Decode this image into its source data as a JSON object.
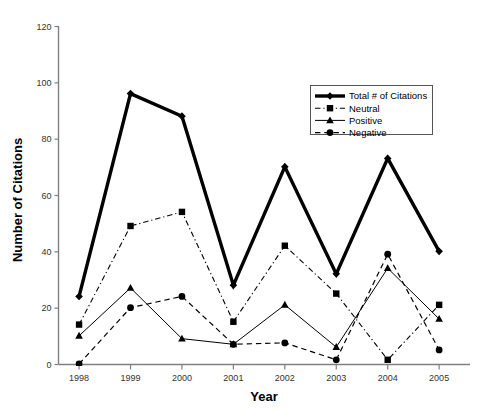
{
  "chart_data": {
    "type": "line",
    "title": "",
    "xlabel": "Year",
    "ylabel": "Number of Citations",
    "categories": [
      "1998",
      "1999",
      "2000",
      "2001",
      "2002",
      "2003",
      "2004",
      "2005"
    ],
    "x": [
      1998,
      1999,
      2000,
      2001,
      2002,
      2003,
      2004,
      2005
    ],
    "xlim": [
      1997.6,
      2005.6
    ],
    "ylim": [
      0,
      120
    ],
    "yticks": [
      0,
      20,
      40,
      60,
      80,
      100,
      120
    ],
    "grid": false,
    "legend_position": "upper right",
    "series": [
      {
        "name": "Total # of Citations",
        "values": [
          24,
          96,
          88,
          28,
          70,
          32,
          73,
          40
        ],
        "marker": "diamond",
        "line_style": "solid",
        "line_width": 3.4,
        "color": "#000000"
      },
      {
        "name": "Neutral",
        "values": [
          14,
          49,
          54,
          15,
          42,
          25,
          1.5,
          21
        ],
        "marker": "square",
        "line_style": "dashdot",
        "line_width": 1.1,
        "color": "#000000"
      },
      {
        "name": "Positive",
        "values": [
          10,
          27,
          9,
          7,
          21,
          6,
          34,
          16
        ],
        "marker": "triangle",
        "line_style": "solid",
        "line_width": 1.0,
        "color": "#000000"
      },
      {
        "name": "Negative",
        "values": [
          0,
          20,
          24,
          7,
          7.5,
          1.5,
          39,
          5
        ],
        "marker": "circle",
        "line_style": "dashed",
        "line_width": 1.2,
        "color": "#000000"
      }
    ]
  },
  "axes": {
    "y_title": "Number of Citations",
    "x_title": "Year",
    "y_tick_labels": [
      "0",
      "20",
      "40",
      "60",
      "80",
      "100",
      "120"
    ],
    "x_tick_labels": [
      "1998",
      "1999",
      "2000",
      "2001",
      "2002",
      "2003",
      "2004",
      "2005"
    ]
  },
  "legend": {
    "entries": [
      {
        "label": "Total # of Citations"
      },
      {
        "label": "Neutral"
      },
      {
        "label": "Positive"
      },
      {
        "label": "Negative"
      }
    ]
  },
  "colors": {
    "foreground": "#000000",
    "axis": "#808080",
    "background": "#ffffff"
  }
}
